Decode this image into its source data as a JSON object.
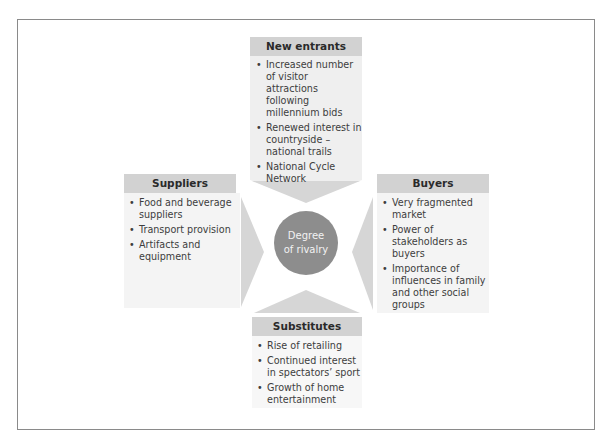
{
  "hub": {
    "label_line1": "Degree",
    "label_line2": "of rivalry"
  },
  "forces": {
    "new_entrants": {
      "header": "New entrants",
      "items": [
        "Increased number of visitor attractions following millennium bids",
        "Renewed interest in countryside – national trails",
        "National Cycle Network"
      ]
    },
    "suppliers": {
      "header": "Suppliers",
      "items": [
        "Food and beverage suppliers",
        "Transport provision",
        "Artifacts and equipment"
      ]
    },
    "buyers": {
      "header": "Buyers",
      "items": [
        "Very fragmented market",
        "Power of stakeholders as buyers",
        "Importance of influences in family and other social groups"
      ]
    },
    "substitutes": {
      "header": "Substitutes",
      "items": [
        "Rise of retailing",
        "Continued interest in spectators’ sport",
        "Growth of home entertainment"
      ]
    }
  },
  "colors": {
    "header_bg": "#d2d2d2",
    "arrow_fill": "#d6d6d6",
    "hub_fill": "#8d8d8d",
    "border": "#8a8a8a"
  }
}
